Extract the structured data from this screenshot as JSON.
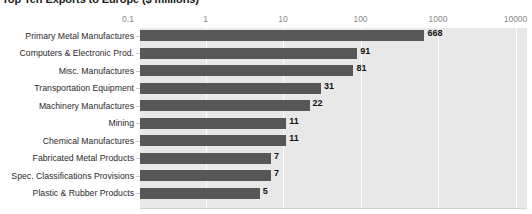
{
  "chart_data": {
    "type": "bar",
    "orientation": "horizontal",
    "title": "Top Ten Exports to Europe ($ millions)",
    "xlabel": "",
    "ylabel": "",
    "xscale": "log",
    "xlim": [
      0.1,
      10000
    ],
    "xticks": [
      "0.1",
      "1",
      "10",
      "100",
      "1000",
      "10000"
    ],
    "grid": true,
    "legend": "none",
    "categories": [
      "Primary Metal Manufactures",
      "Computers & Electronic Prod.",
      "Misc. Manufactures",
      "Transportation Equipment",
      "Machinery Manufactures",
      "Mining",
      "Chemical Manufactures",
      "Fabricated Metal Products",
      "Spec. Classifications Provisions",
      "Plastic & Rubber Products"
    ],
    "values": [
      668,
      91,
      81,
      31,
      22,
      11,
      11,
      7,
      7,
      5
    ],
    "value_labels": [
      "668",
      "91",
      "81",
      "31",
      "22",
      "11",
      "11",
      "7",
      "7",
      "5"
    ],
    "colors": {
      "bar": "#575757",
      "plot_background": "#e8e8e8",
      "gridline": "#ffffff",
      "value_label": "#111111",
      "tick_label": "#8a8a8a",
      "category_label": "#2b2b2b",
      "title": "#1a1a1a"
    }
  }
}
